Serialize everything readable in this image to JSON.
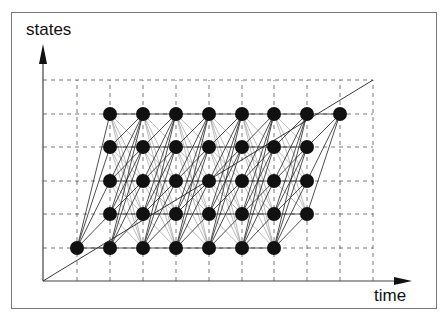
{
  "diagram": {
    "y_axis_label": "states",
    "x_axis_label": "time",
    "colors": {
      "node": "#111111",
      "edge": "#222222",
      "grid": "#555555",
      "frame": "#777777"
    },
    "grid": {
      "origin": [
        43,
        281
      ],
      "x_lines": [
        77,
        110,
        143,
        176,
        209,
        242,
        274,
        307,
        340,
        373
      ],
      "y_lines": [
        248,
        214,
        181,
        147,
        114,
        80
      ],
      "top": 80,
      "right": 373
    },
    "diagonal": {
      "from": [
        43,
        281
      ],
      "to": [
        373,
        80
      ]
    },
    "node_rows": [
      {
        "state": 1,
        "y": 248,
        "cols": [
          77,
          110,
          143,
          176,
          209,
          242,
          274
        ]
      },
      {
        "state": 2,
        "y": 214,
        "cols": [
          110,
          143,
          176,
          209,
          242,
          274,
          307
        ]
      },
      {
        "state": 3,
        "y": 181,
        "cols": [
          110,
          143,
          176,
          209,
          242,
          274,
          307
        ]
      },
      {
        "state": 4,
        "y": 147,
        "cols": [
          110,
          143,
          176,
          209,
          242,
          274,
          307
        ]
      },
      {
        "state": 5,
        "y": 114,
        "cols": [
          110,
          143,
          176,
          209,
          242,
          274,
          307,
          340
        ]
      }
    ],
    "node_radius": 7
  }
}
